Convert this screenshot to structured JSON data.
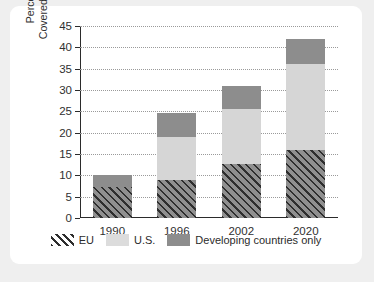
{
  "chart_data": {
    "type": "bar",
    "stacked": true,
    "title": "",
    "xlabel": "",
    "ylabel": "Percentage of World Trade Covered by Regional Agreements",
    "ylabel_lines": [
      "Percentage of World Trade",
      "Covered by Regional Agreements"
    ],
    "categories": [
      "1990",
      "1996",
      "2002",
      "2020"
    ],
    "series": [
      {
        "name": "EU",
        "color": "#8f8f8f",
        "pattern": "diagonal-hatch",
        "values": [
          7.2,
          8.8,
          12.6,
          16.0
        ]
      },
      {
        "name": "U.S.",
        "color": "#d6d6d6",
        "pattern": "solid",
        "values": [
          0,
          10.2,
          13.0,
          20.0
        ]
      },
      {
        "name": "Developing countries only",
        "color": "#8d8d8d",
        "pattern": "solid",
        "values": [
          2.8,
          5.5,
          5.4,
          6.0
        ]
      }
    ],
    "totals": [
      10.0,
      24.5,
      31.0,
      42.0
    ],
    "ylim": [
      0,
      45
    ],
    "yticks": [
      0,
      5,
      10,
      15,
      20,
      25,
      30,
      35,
      40,
      45
    ],
    "ytick_labels": [
      "0",
      "5",
      "10",
      "15",
      "20",
      "25",
      "30",
      "35",
      "40",
      "45"
    ],
    "grid": "horizontal-dotted",
    "legend_position": "bottom-center",
    "legend": [
      "EU",
      "U.S.",
      "Developing countries only"
    ]
  }
}
